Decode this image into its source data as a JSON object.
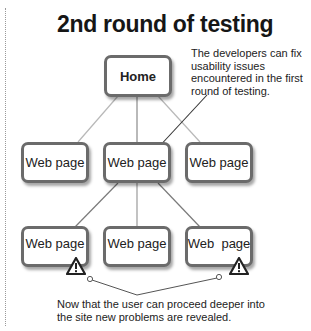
{
  "title": "2nd round of testing",
  "nodes": {
    "home": "Home",
    "level1": [
      "Web page",
      "Web page",
      "Web page"
    ],
    "level2": [
      "Web page",
      "Web page",
      "Web  page"
    ]
  },
  "annotations": {
    "fix_note": "The developers can fix usability issues encountered in the first round of testing.",
    "problems_note": "Now that the user can proceed deeper into the site new problems are revealed."
  },
  "icons": {
    "warning": "warning-triangle-icon"
  },
  "colors": {
    "box_border": "#6b6b6b",
    "link_line": "#9a9a9a",
    "callout_line": "#333333",
    "text": "#1a1a1a"
  }
}
